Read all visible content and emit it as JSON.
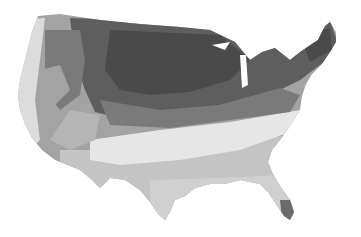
{
  "map": {
    "subject": "contiguous-united-states",
    "style": "grayscale-zone-map",
    "background": "#ffffff",
    "zone_colors": {
      "zone_darkest": "#4a4a4a",
      "zone_dark": "#5e5e5e",
      "zone_mid_dark": "#7a7a7a",
      "zone_mid": "#a3a3a3",
      "zone_light": "#c4c4c4",
      "zone_lighter": "#dcdcdc",
      "zone_lightest": "#ececec"
    }
  }
}
